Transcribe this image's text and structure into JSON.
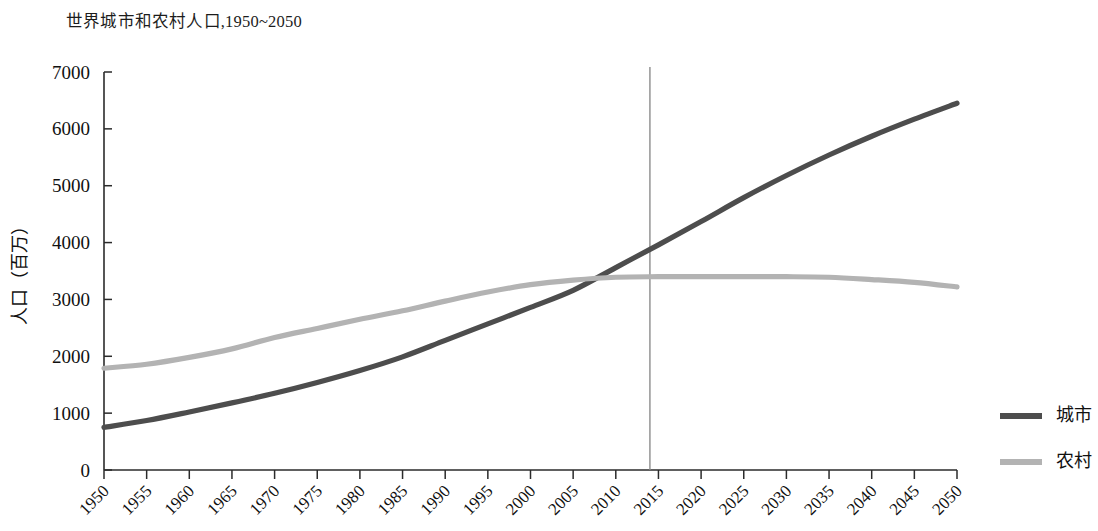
{
  "chart_data": {
    "type": "line",
    "title": "世界城市和农村人口,1950~2050",
    "xlabel": "",
    "ylabel": "人口（百万）",
    "xlim": [
      1950,
      2050
    ],
    "ylim": [
      0,
      7000
    ],
    "grid": false,
    "legend_position": "right",
    "x": [
      1950,
      1955,
      1960,
      1965,
      1970,
      1975,
      1980,
      1985,
      1990,
      1995,
      2000,
      2005,
      2010,
      2015,
      2020,
      2025,
      2030,
      2035,
      2040,
      2045,
      2050
    ],
    "categories": [
      "1950",
      "1955",
      "1960",
      "1965",
      "1970",
      "1975",
      "1980",
      "1985",
      "1990",
      "1995",
      "2000",
      "2005",
      "2010",
      "2015",
      "2020",
      "2025",
      "2030",
      "2035",
      "2040",
      "2045",
      "2050"
    ],
    "series": [
      {
        "name": "城市",
        "color": "#4d4d4d",
        "values": [
          750,
          870,
          1020,
          1180,
          1350,
          1540,
          1750,
          1990,
          2280,
          2570,
          2860,
          3160,
          3560,
          3960,
          4370,
          4790,
          5180,
          5540,
          5870,
          6170,
          6450
        ]
      },
      {
        "name": "农村",
        "color": "#b3b3b3",
        "values": [
          1790,
          1860,
          1980,
          2130,
          2330,
          2490,
          2650,
          2800,
          2970,
          3130,
          3260,
          3340,
          3390,
          3400,
          3400,
          3400,
          3400,
          3390,
          3350,
          3300,
          3220
        ]
      }
    ],
    "yticks": [
      0,
      1000,
      2000,
      3000,
      4000,
      5000,
      6000,
      7000
    ],
    "ytick_labels": [
      "0",
      "1000",
      "2000",
      "3000",
      "4000",
      "5000",
      "6000",
      "7000"
    ],
    "annotations": [
      {
        "name": "current-year-marker",
        "type": "vline",
        "x": 2014
      }
    ]
  },
  "legend": {
    "items": [
      {
        "label": "城市",
        "color": "#4d4d4d"
      },
      {
        "label": "农村",
        "color": "#b3b3b3"
      }
    ]
  },
  "colors": {
    "urban": "#4d4d4d",
    "rural": "#b3b3b3",
    "axis": "#2b2b2b",
    "vline": "#8c8c8c",
    "background": "#ffffff"
  }
}
